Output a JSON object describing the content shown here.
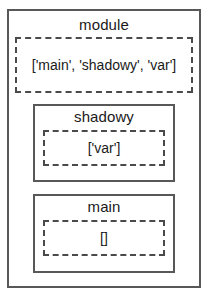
{
  "diagram": {
    "type": "nested-scope-diagram",
    "colors": {
      "border": "#585858",
      "namespace_border": "#4a4a4a",
      "text": "#1a1a1a",
      "background": "#ffffff"
    },
    "scopes": [
      {
        "name": "module",
        "title": "module",
        "namespace": "['main', 'shadowy', 'var']",
        "names": [
          "main",
          "shadowy",
          "var"
        ]
      },
      {
        "name": "shadowy",
        "title": "shadowy",
        "namespace": "['var']",
        "names": [
          "var"
        ]
      },
      {
        "name": "main",
        "title": "main",
        "namespace": "[]",
        "names": []
      }
    ]
  }
}
